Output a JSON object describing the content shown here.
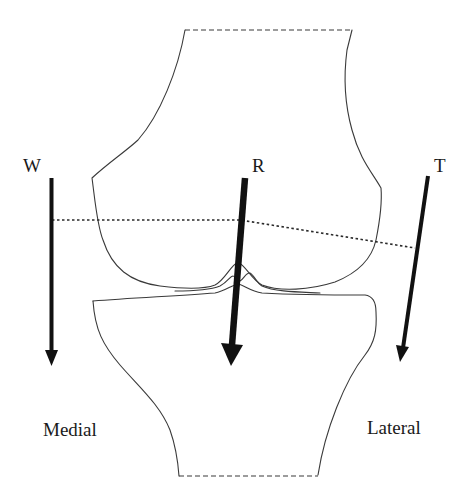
{
  "diagram": {
    "colors": {
      "background": "#ffffff",
      "outline": "#3a3a3a",
      "arrow": "#111111",
      "text": "#1a1a1a"
    },
    "forces": [
      {
        "id": "W",
        "label": "W",
        "meaning": "body weight",
        "side": "medial"
      },
      {
        "id": "R",
        "label": "R",
        "meaning": "joint reaction force",
        "side": "center"
      },
      {
        "id": "T",
        "label": "T",
        "meaning": "lateral tension",
        "side": "lateral"
      }
    ],
    "sides": {
      "medial": "Medial",
      "lateral": "Lateral"
    },
    "structures": {
      "femur": "femur (distal)",
      "tibia": "tibia (proximal)",
      "lever_line": "dotted moment arm line"
    }
  }
}
